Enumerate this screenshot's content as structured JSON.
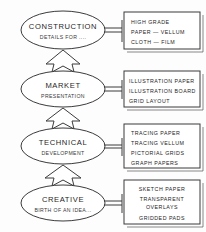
{
  "diagram": {
    "flow_direction": "bottom-to-top",
    "colors": {
      "ink": "#3b3b3b",
      "background": "#fdfdfd",
      "text": "#242424"
    },
    "stages": [
      {
        "id": "construction",
        "title": "CONSTRUCTION",
        "subtitle": "DETAILS FOR ....",
        "materials": [
          "HIGH  GRADE",
          "PAPER  —  VELLUM",
          "CLOTH  —  FILM"
        ]
      },
      {
        "id": "market",
        "title": "MARKET",
        "subtitle": "PRESENTATION",
        "materials": [
          "ILLUSTRATION  PAPER",
          "ILLUSTRATION  BOARD",
          "GRID  LAYOUT"
        ]
      },
      {
        "id": "technical",
        "title": "TECHNICAL",
        "subtitle": "DEVELOPMENT",
        "materials": [
          "TRACING  PAPER",
          "TRACING  VELLUM",
          "PICTORIAL  GRIDS",
          "GRAPH  PAPERS"
        ]
      },
      {
        "id": "creative",
        "title": "CREATIVE",
        "subtitle": "BIRTH OF AN IDEA...",
        "materials": [
          "SKETCH  PAPER",
          "TRANSPARENT",
          "OVERLAYS",
          "GRIDDED  PADS"
        ]
      }
    ]
  }
}
